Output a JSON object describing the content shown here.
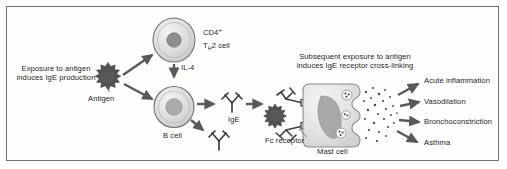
{
  "figure": {
    "border_color": "#6f7072",
    "background": "#ffffff",
    "text_color": "#231f20"
  },
  "palette": {
    "cell_fill": "#d9dadb",
    "cell_fill_light": "#e8e9ea",
    "cell_stroke": "#6f7072",
    "nucleus": "#8c8d8f",
    "antigen": "#4f5052",
    "arrow": "#58595b",
    "antibody": "#404042",
    "granule": "#404042",
    "mast_fill": "#e3e4e5",
    "mast_nucleus": "#a6a8aa"
  },
  "labels": {
    "exposure_line1": "Exposure to antigen",
    "exposure_line2": "induces IgE production",
    "antigen": "Antigen",
    "cd4_line1": "CD4",
    "cd4_sup": "+",
    "th2_pre": "T",
    "th2_sub": "H",
    "th2_post": "2 cell",
    "il4": "IL-4",
    "bcell": "B cell",
    "ige": "IgE",
    "subsequent_line1": "Subsequent exposure to antigen",
    "subsequent_line2": "induces IgE receptor cross-linking",
    "fc_receptor": "Fc receptor",
    "mast_cell": "Mast cell"
  },
  "outcomes": [
    {
      "label": "Acute inflammation"
    },
    {
      "label": "Vasodilation"
    },
    {
      "label": "Bronchoconstriction"
    },
    {
      "label": "Asthma"
    }
  ]
}
